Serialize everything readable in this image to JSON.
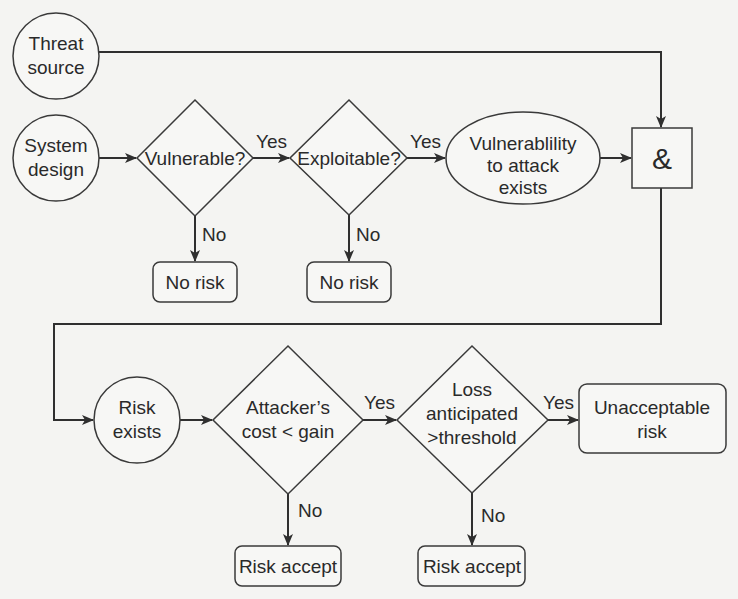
{
  "diagram": {
    "type": "flowchart",
    "nodes": {
      "threat_source": {
        "shape": "circle",
        "lines": [
          "Threat",
          "source"
        ]
      },
      "system_design": {
        "shape": "circle",
        "lines": [
          "System",
          "design"
        ]
      },
      "vulnerable": {
        "shape": "diamond",
        "lines": [
          "Vulnerable?"
        ]
      },
      "exploitable": {
        "shape": "diamond",
        "lines": [
          "Exploitable?"
        ]
      },
      "vuln_exists": {
        "shape": "ellipse",
        "lines": [
          "Vulnerablility",
          "to attack",
          "exists"
        ]
      },
      "and_gate": {
        "shape": "square",
        "lines": [
          "&"
        ]
      },
      "no_risk_1": {
        "shape": "rounded-rect",
        "lines": [
          "No risk"
        ]
      },
      "no_risk_2": {
        "shape": "rounded-rect",
        "lines": [
          "No risk"
        ]
      },
      "risk_exists": {
        "shape": "circle",
        "lines": [
          "Risk",
          "exists"
        ]
      },
      "cost_gain": {
        "shape": "diamond",
        "lines": [
          "Attacker’s",
          "cost < gain"
        ]
      },
      "loss_threshold": {
        "shape": "diamond",
        "lines": [
          "Loss",
          "anticipated",
          ">threshold"
        ]
      },
      "unacceptable": {
        "shape": "rounded-rect",
        "lines": [
          "Unacceptable",
          "risk"
        ]
      },
      "risk_accept_1": {
        "shape": "rounded-rect",
        "lines": [
          "Risk accept"
        ]
      },
      "risk_accept_2": {
        "shape": "rounded-rect",
        "lines": [
          "Risk accept"
        ]
      }
    },
    "edge_labels": {
      "vulnerable_yes": "Yes",
      "vulnerable_no": "No",
      "exploitable_yes": "Yes",
      "exploitable_no": "No",
      "cost_gain_yes": "Yes",
      "cost_gain_no": "No",
      "loss_yes": "Yes",
      "loss_no": "No"
    },
    "edges": [
      {
        "from": "threat_source",
        "to": "and_gate",
        "label": ""
      },
      {
        "from": "system_design",
        "to": "vulnerable",
        "label": ""
      },
      {
        "from": "vulnerable",
        "to": "exploitable",
        "label": "Yes"
      },
      {
        "from": "vulnerable",
        "to": "no_risk_1",
        "label": "No"
      },
      {
        "from": "exploitable",
        "to": "vuln_exists",
        "label": "Yes"
      },
      {
        "from": "exploitable",
        "to": "no_risk_2",
        "label": "No"
      },
      {
        "from": "vuln_exists",
        "to": "and_gate",
        "label": ""
      },
      {
        "from": "and_gate",
        "to": "risk_exists",
        "label": ""
      },
      {
        "from": "risk_exists",
        "to": "cost_gain",
        "label": ""
      },
      {
        "from": "cost_gain",
        "to": "loss_threshold",
        "label": "Yes"
      },
      {
        "from": "cost_gain",
        "to": "risk_accept_1",
        "label": "No"
      },
      {
        "from": "loss_threshold",
        "to": "unacceptable",
        "label": "Yes"
      },
      {
        "from": "loss_threshold",
        "to": "risk_accept_2",
        "label": "No"
      }
    ],
    "colors": {
      "stroke": "#3a3a3a",
      "text": "#2a2a2a",
      "background": "#f4f4f2"
    }
  }
}
